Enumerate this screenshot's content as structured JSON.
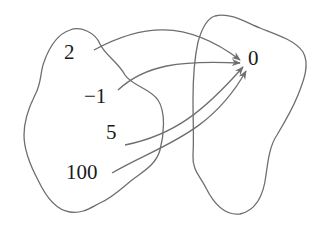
{
  "diagram": {
    "type": "function-mapping",
    "domain_set": {
      "elements": [
        {
          "label": "2"
        },
        {
          "label": "−1"
        },
        {
          "label": "5"
        },
        {
          "label": "100"
        }
      ]
    },
    "codomain_set": {
      "elements": [
        {
          "label": "0"
        }
      ]
    },
    "mappings": [
      {
        "from": "2",
        "to": "0"
      },
      {
        "from": "−1",
        "to": "0"
      },
      {
        "from": "5",
        "to": "0"
      },
      {
        "from": "100",
        "to": "0"
      }
    ],
    "colors": {
      "outline": "#6e6e6e",
      "text": "#1a1a1a",
      "background": "#ffffff"
    }
  }
}
